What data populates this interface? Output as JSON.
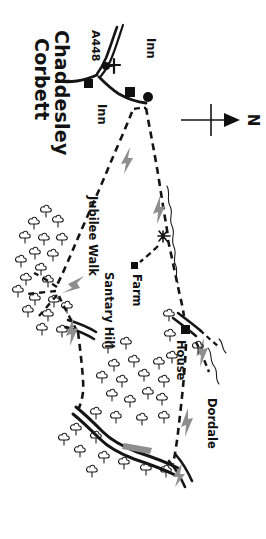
{
  "map": {
    "kind": "hand-drawn walking route map",
    "orientation_note": "all labels rendered rotated 90 degrees clockwise",
    "compass": {
      "name": "north-arrow",
      "label": "N",
      "points": "right"
    },
    "places": [
      {
        "id": "chaddesley",
        "label": "Chaddesley",
        "type": "village-name"
      },
      {
        "id": "corbett",
        "label": "Corbett",
        "type": "village-name"
      },
      {
        "id": "inn_top",
        "label": "Inn",
        "type": "point-of-interest"
      },
      {
        "id": "inn_left",
        "label": "Inn",
        "type": "point-of-interest"
      },
      {
        "id": "farm",
        "label": "Farm",
        "type": "point-of-interest"
      },
      {
        "id": "house",
        "label": "House",
        "type": "point-of-interest"
      },
      {
        "id": "dordale",
        "label": "Dordale",
        "type": "locality"
      }
    ],
    "roads": [
      {
        "id": "a448",
        "label": "A448",
        "type": "a-road"
      }
    ],
    "paths": [
      {
        "id": "jubilee_walk",
        "label": "Jubilee Walk",
        "type": "footpath"
      },
      {
        "id": "santary_hill",
        "label": "Santary Hill",
        "type": "footpath"
      }
    ],
    "symbols": [
      {
        "name": "church-cross-icon",
        "meaning": "church"
      },
      {
        "name": "building-marker-icon",
        "meaning": "building"
      },
      {
        "name": "tree-icon",
        "meaning": "woodland"
      },
      {
        "name": "stream-line",
        "meaning": "stream"
      },
      {
        "name": "direction-arrow-icon",
        "meaning": "walk direction"
      }
    ],
    "colors": {
      "ink": "#141414",
      "arrow": "#8e8e8e",
      "paper": "#ffffff"
    }
  }
}
